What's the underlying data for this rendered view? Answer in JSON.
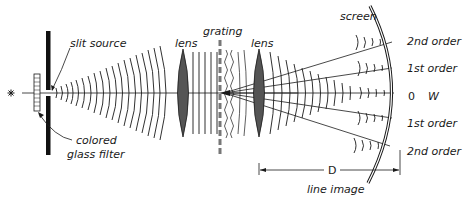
{
  "diagram": {
    "type": "diffraction-grating-spectrometer",
    "labels": {
      "slit_source": "slit source",
      "colored_glass_filter_line1": "colored",
      "colored_glass_filter_line2": "glass filter",
      "lens_left": "lens",
      "grating": "grating",
      "lens_right": "lens",
      "screen": "screen",
      "distance": "D",
      "line_image": "line image",
      "source_symbol": "✳"
    },
    "orders": [
      {
        "label": "2nd order"
      },
      {
        "label": "1st order"
      },
      {
        "label": "0",
        "extra": "W"
      },
      {
        "label": "1st order"
      },
      {
        "label": "2nd order"
      }
    ],
    "colors": {
      "ink": "#1a1a1a",
      "lens_fill": "#555555",
      "grating": "#777777",
      "background": "#ffffff"
    }
  }
}
